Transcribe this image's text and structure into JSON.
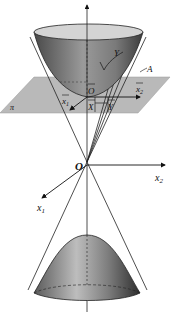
{
  "diagram": {
    "title": "",
    "type": "3d-geometry",
    "labels": {
      "origin": "O",
      "x1_axis": "x",
      "x1_sub": "1",
      "x2_axis": "x",
      "x2_sub": "2",
      "plane": "π",
      "o_bar": "O",
      "x_bar": "X",
      "y_bar": "Y",
      "x1_bar": "x",
      "x1_bar_sub": "1",
      "x2_bar": "x",
      "x2_bar_sub": "2",
      "y_curve": "Y",
      "a_point": "A"
    },
    "colors": {
      "plane_fill": "#b8b8b8",
      "surface_dark": "#5a5a5a",
      "surface_light": "#d8d8d8",
      "line": "#222222"
    }
  }
}
